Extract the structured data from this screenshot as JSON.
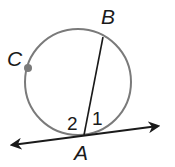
{
  "diagram": {
    "circle": {
      "cx": 78,
      "cy": 82,
      "r": 53,
      "stroke": "#7a7a7a"
    },
    "points": {
      "A": {
        "label": "A",
        "x": 84,
        "y": 135
      },
      "B": {
        "label": "B",
        "x": 103,
        "y": 37
      },
      "C": {
        "label": "C",
        "x": 28,
        "y": 68,
        "dot_color": "#7a7a7a"
      }
    },
    "chord": {
      "from": "A",
      "to": "B"
    },
    "tangent_line": {
      "through": "A",
      "x1": 10,
      "y1": 145,
      "x2": 160,
      "y2": 126,
      "arrows": "both"
    },
    "angles": [
      {
        "label": "1",
        "position": "right of chord AB, above tangent"
      },
      {
        "label": "2",
        "position": "left of chord AB, above tangent"
      }
    ]
  }
}
